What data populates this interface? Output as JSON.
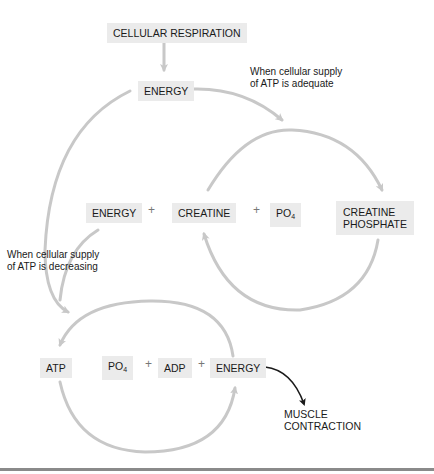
{
  "nodes": {
    "cellular_respiration": "CELLULAR RESPIRATION",
    "energy_top": "ENERGY",
    "energy_mid": "ENERGY",
    "creatine": "CREATINE",
    "po4_mid": "PO",
    "po4_mid_sub": "4",
    "creatine_phosphate_line1": "CREATINE",
    "creatine_phosphate_line2": "PHOSPHATE",
    "atp": "ATP",
    "po4_bottom": "PO",
    "po4_bottom_sub": "4",
    "adp": "ADP",
    "energy_bottom": "ENERGY",
    "muscle_contraction_line1": "MUSCLE",
    "muscle_contraction_line2": "CONTRACTION"
  },
  "operators": {
    "plus": "+"
  },
  "notes": {
    "adequate_line1": "When cellular supply",
    "adequate_line2": "of ATP is adequate",
    "decreasing_line1": "When cellular supply",
    "decreasing_line2": "of ATP is decreasing"
  },
  "colors": {
    "arrow_gray": "#c8c8c8",
    "arrow_dark": "#1a1a1a",
    "box_fill": "#ebebeb",
    "rule": "#8a8a8a"
  }
}
